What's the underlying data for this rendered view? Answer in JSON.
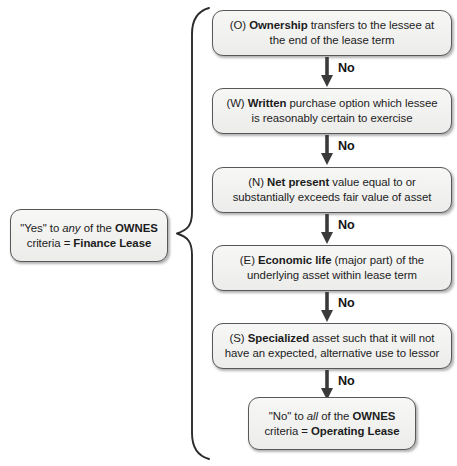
{
  "diagram": {
    "colors": {
      "node_fill": "#f2f2f1",
      "node_border": "#58585a",
      "text": "#1c1c1c",
      "arrow": "#3a3a3a",
      "brace": "#2b2b2b",
      "background": "#ffffff"
    },
    "top_clipped_text": "",
    "summary_box": {
      "id": "finance-lease-summary",
      "lines": [
        {
          "segments": [
            {
              "text": "\"Yes\" to ",
              "style": "normal"
            },
            {
              "text": "any",
              "style": "italic"
            },
            {
              "text": " of the ",
              "style": "normal"
            },
            {
              "text": "OWNES",
              "style": "bold"
            }
          ]
        },
        {
          "segments": [
            {
              "text": "criteria = ",
              "style": "normal"
            },
            {
              "text": "Finance Lease",
              "style": "bold"
            }
          ]
        }
      ],
      "plain_text": "\"Yes\" to any of the OWNES criteria = Finance Lease"
    },
    "criteria": [
      {
        "id": "ownership",
        "letter": "O",
        "keyword": "Ownership",
        "lines": [
          {
            "segments": [
              {
                "text": "(O) ",
                "style": "normal"
              },
              {
                "text": "Ownership",
                "style": "bold"
              },
              {
                "text": " transfers to the lessee at",
                "style": "normal"
              }
            ]
          },
          {
            "segments": [
              {
                "text": "the end of the lease term",
                "style": "normal"
              }
            ]
          }
        ],
        "plain_text": "(O) Ownership transfers to the lessee at the end of the lease term",
        "exit_label": "No"
      },
      {
        "id": "written",
        "letter": "W",
        "keyword": "Written",
        "lines": [
          {
            "segments": [
              {
                "text": "(W) ",
                "style": "normal"
              },
              {
                "text": "Written",
                "style": "bold"
              },
              {
                "text": " purchase option which lessee",
                "style": "normal"
              }
            ]
          },
          {
            "segments": [
              {
                "text": "is reasonably certain to exercise",
                "style": "normal"
              }
            ]
          }
        ],
        "plain_text": "(W) Written purchase option which lessee is reasonably certain to exercise",
        "exit_label": "No"
      },
      {
        "id": "net-present",
        "letter": "N",
        "keyword": "Net present",
        "lines": [
          {
            "segments": [
              {
                "text": "(N) ",
                "style": "normal"
              },
              {
                "text": "Net present",
                "style": "bold"
              },
              {
                "text": " value equal to or",
                "style": "normal"
              }
            ]
          },
          {
            "segments": [
              {
                "text": "substantially exceeds fair value of asset",
                "style": "normal"
              }
            ]
          }
        ],
        "plain_text": "(N) Net present value equal to or substantially exceeds fair value of asset",
        "exit_label": "No"
      },
      {
        "id": "economic-life",
        "letter": "E",
        "keyword": "Economic life",
        "lines": [
          {
            "segments": [
              {
                "text": "(E) ",
                "style": "normal"
              },
              {
                "text": "Economic life",
                "style": "bold"
              },
              {
                "text": " (major part) of the",
                "style": "normal"
              }
            ]
          },
          {
            "segments": [
              {
                "text": "underlying asset within lease term",
                "style": "normal"
              }
            ]
          }
        ],
        "plain_text": "(E) Economic life (major part) of the underlying asset within lease term",
        "exit_label": "No"
      },
      {
        "id": "specialized",
        "letter": "S",
        "keyword": "Specialized",
        "lines": [
          {
            "segments": [
              {
                "text": "(S) ",
                "style": "normal"
              },
              {
                "text": "Specialized",
                "style": "bold"
              },
              {
                "text": " asset such that it will not",
                "style": "normal"
              }
            ]
          },
          {
            "segments": [
              {
                "text": "have an expected, alternative use to lessor",
                "style": "normal"
              }
            ]
          }
        ],
        "plain_text": "(S) Specialized asset such that it will not have an expected, alternative use to lessor",
        "exit_label": "No"
      }
    ],
    "result_box": {
      "id": "operating-lease-result",
      "lines": [
        {
          "segments": [
            {
              "text": "\"No\" to ",
              "style": "normal"
            },
            {
              "text": "all",
              "style": "italic"
            },
            {
              "text": " of the ",
              "style": "normal"
            },
            {
              "text": "OWNES",
              "style": "bold"
            }
          ]
        },
        {
          "segments": [
            {
              "text": "criteria = ",
              "style": "normal"
            },
            {
              "text": "Operating Lease",
              "style": "bold"
            }
          ]
        }
      ],
      "plain_text": "\"No\" to all of the OWNES criteria = Operating Lease"
    }
  }
}
